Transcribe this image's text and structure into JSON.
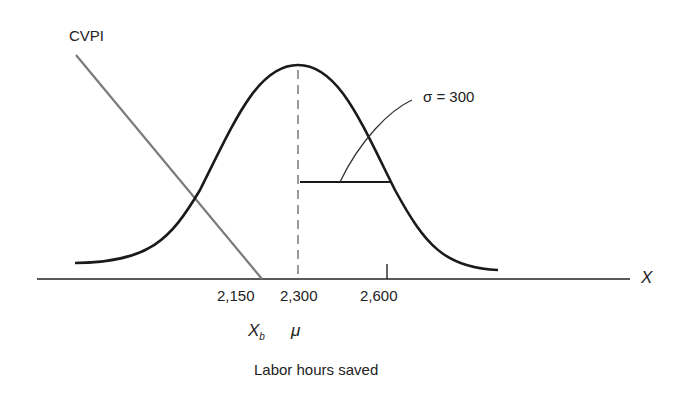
{
  "diagram": {
    "cvpi_label": "CVPI",
    "sigma_label": "σ = 300",
    "axis_var": "X",
    "ticks": [
      {
        "value": "2,150",
        "symbol": "X",
        "sub": "b"
      },
      {
        "value": "2,300",
        "symbol": "μ"
      },
      {
        "value": "2,600"
      }
    ],
    "xlabel": "Labor hours saved"
  },
  "colors": {
    "curve": "#1a1a1a",
    "cvpi_line": "#7a7a7a",
    "dashed": "#999999",
    "axis": "#222222"
  }
}
